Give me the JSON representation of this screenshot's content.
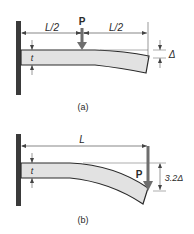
{
  "figure_a": {
    "caption": "(a)",
    "span_left_label": "L/2",
    "span_right_label": "L/2",
    "load_label": "P",
    "thickness_label": "t",
    "deflection_label": "Δ"
  },
  "figure_b": {
    "caption": "(b)",
    "span_label": "L",
    "load_label": "P",
    "thickness_label": "t",
    "deflection_label": "3.2Δ"
  },
  "colors": {
    "wall": "#3a3a3a",
    "beam_fill": "#e2e2e2",
    "beam_stroke": "#2a2a2a",
    "load_arrow": "#6e6e6e",
    "dimension": "#555555"
  }
}
